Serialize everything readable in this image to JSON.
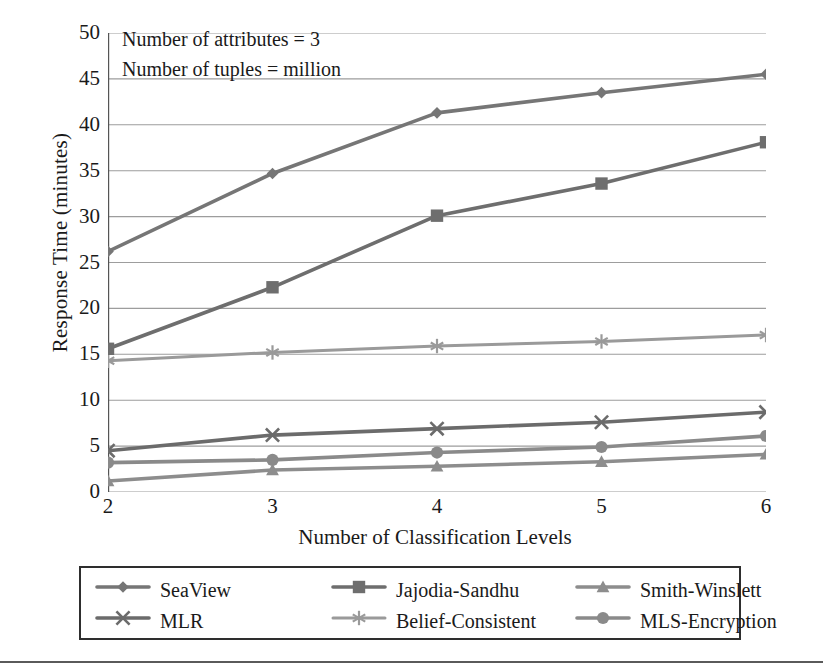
{
  "chart_data": {
    "type": "line",
    "title": "",
    "xlabel": "Number of Classification Levels",
    "ylabel": "Response Time (minutes)",
    "x": [
      2,
      3,
      4,
      5,
      6
    ],
    "xtick_labels": [
      "2",
      "3",
      "4",
      "5",
      "6"
    ],
    "ytick_labels": [
      "0",
      "5",
      "10",
      "15",
      "20",
      "25",
      "30",
      "35",
      "40",
      "45",
      "50"
    ],
    "yticks": [
      0,
      5,
      10,
      15,
      20,
      25,
      30,
      35,
      40,
      45,
      50
    ],
    "xlim": [
      2,
      6
    ],
    "ylim": [
      0,
      50
    ],
    "grid": "horizontal",
    "legend_position": "below-plot",
    "annotations": [
      "Number of attributes = 3",
      "Number of tuples = million"
    ],
    "series": [
      {
        "name": "SeaView",
        "marker": "diamond",
        "color": "#767676",
        "values": [
          26.2,
          34.7,
          41.3,
          43.5,
          45.5
        ]
      },
      {
        "name": "Jajodia-Sandhu",
        "marker": "square",
        "color": "#6e6e6e",
        "values": [
          15.6,
          22.3,
          30.1,
          33.6,
          38.1
        ]
      },
      {
        "name": "Smith-Winslett",
        "marker": "triangle",
        "color": "#8d8d8d",
        "values": [
          1.2,
          2.4,
          2.8,
          3.3,
          4.1
        ]
      },
      {
        "name": "MLR",
        "marker": "x",
        "color": "#6b6b6b",
        "values": [
          4.5,
          6.2,
          6.9,
          7.6,
          8.7
        ]
      },
      {
        "name": "Belief-Consistent",
        "marker": "asterisk",
        "color": "#9a9a9a",
        "values": [
          14.3,
          15.2,
          15.9,
          16.4,
          17.1
        ]
      },
      {
        "name": "MLS-Encryption",
        "marker": "circle",
        "color": "#8a8a8a",
        "values": [
          3.2,
          3.5,
          4.3,
          4.9,
          6.1
        ]
      }
    ]
  },
  "legend": {
    "items": [
      {
        "label": "SeaView"
      },
      {
        "label": "Jajodia-Sandhu"
      },
      {
        "label": "Smith-Winslett"
      },
      {
        "label": "MLR"
      },
      {
        "label": "Belief-Consistent"
      },
      {
        "label": "MLS-Encryption"
      }
    ]
  },
  "colors": {
    "axis": "#555555",
    "grid": "#8c8c8c",
    "text": "#1a1a1a",
    "legend_border": "#2e2e2e",
    "bottom_rule": "#5a5a5a"
  }
}
